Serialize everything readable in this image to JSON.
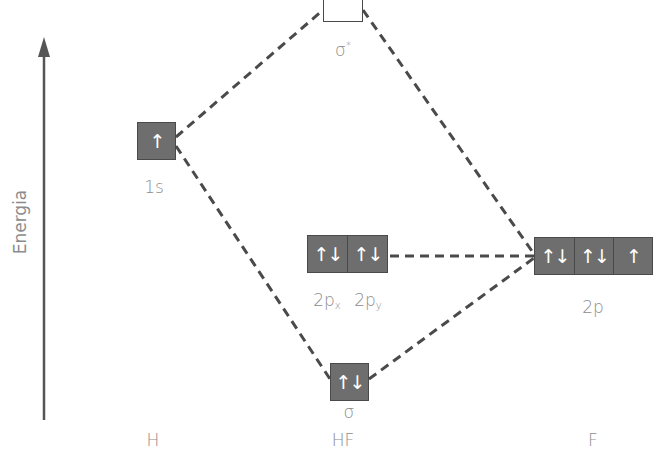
{
  "diagram": {
    "axis_label": "Energia",
    "columns": {
      "left": "H",
      "center": "HF",
      "right": "F"
    },
    "orbitals": {
      "h_1s": {
        "label": "1s",
        "electrons": "↑"
      },
      "sigma_star": {
        "label": "σ",
        "superscript": "*",
        "electrons": ""
      },
      "nonbonding_2px": {
        "label": "2p",
        "subscript": "x",
        "electrons": "↑↓"
      },
      "nonbonding_2py": {
        "label": "2p",
        "subscript": "y",
        "electrons": "↑↓"
      },
      "f_2p": {
        "label": "2p",
        "electrons": [
          "↑↓",
          "↑↓",
          "↑"
        ]
      },
      "sigma": {
        "label": "σ",
        "electrons": "↑↓"
      }
    },
    "colors": {
      "filled_box": "#6e6e6e",
      "box_border": "#4a4a4a",
      "dashed_line": "#4a4a4a",
      "label_text": "#8c8c8c",
      "axis": "#555555"
    }
  }
}
